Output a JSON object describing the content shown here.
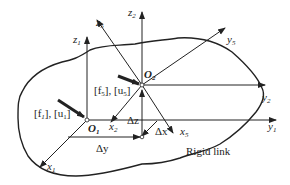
{
  "diagram": {
    "type": "coordinate-frames-rigid-link",
    "body_label": "Rigid link",
    "origins": {
      "o1": {
        "label": "O",
        "sub": "1"
      },
      "o2": {
        "label": "O",
        "sub": "2"
      }
    },
    "axes": {
      "x1": {
        "label": "x",
        "sub": "1"
      },
      "y1": {
        "label": "y",
        "sub": "1"
      },
      "z1": {
        "label": "z",
        "sub": "1"
      },
      "x2": {
        "label": "x",
        "sub": "2"
      },
      "y2": {
        "label": "y",
        "sub": "2"
      },
      "z2": {
        "label": "z",
        "sub": "2"
      },
      "x5": {
        "label": "x",
        "sub": "5"
      },
      "y5": {
        "label": "y",
        "sub": "5"
      },
      "z5": {
        "label": "z",
        "sub": "5"
      }
    },
    "offsets": {
      "dx": "Δx",
      "dy": "Δy",
      "dz": "Δz"
    },
    "forces": {
      "f1": {
        "f": "[f",
        "fsub": "1",
        "mid": "], [u",
        "usub": "1",
        "end": "]"
      },
      "f5": {
        "f": "[f",
        "fsub": "5",
        "mid": "], [u",
        "usub": "5",
        "end": "]"
      }
    },
    "colors": {
      "line": "#222222",
      "background": "#ffffff"
    }
  }
}
